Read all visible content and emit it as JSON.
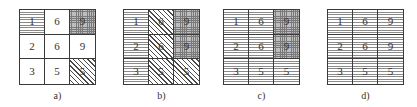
{
  "figure": {
    "patterns_legend": {
      "white": "no fill",
      "h": "horizontal lines",
      "d": "diagonal hatching",
      "x": "crosshatch / grid"
    },
    "panels": [
      {
        "label": "a)",
        "cells": [
          {
            "value": "1",
            "pattern": "h"
          },
          {
            "value": "6",
            "pattern": "white"
          },
          {
            "value": "9",
            "pattern": "x"
          },
          {
            "value": "2",
            "pattern": "white"
          },
          {
            "value": "6",
            "pattern": "white"
          },
          {
            "value": "9",
            "pattern": "white"
          },
          {
            "value": "3",
            "pattern": "white"
          },
          {
            "value": "5",
            "pattern": "white"
          },
          {
            "value": "5",
            "pattern": "d"
          }
        ]
      },
      {
        "label": "b)",
        "cells": [
          {
            "value": "1",
            "pattern": "h"
          },
          {
            "value": "6",
            "pattern": "d"
          },
          {
            "value": "9",
            "pattern": "x"
          },
          {
            "value": "2",
            "pattern": "h"
          },
          {
            "value": "6",
            "pattern": "d"
          },
          {
            "value": "9",
            "pattern": "x"
          },
          {
            "value": "3",
            "pattern": "h"
          },
          {
            "value": "5",
            "pattern": "d"
          },
          {
            "value": "5",
            "pattern": "d"
          }
        ]
      },
      {
        "label": "c)",
        "cells": [
          {
            "value": "1",
            "pattern": "h"
          },
          {
            "value": "6",
            "pattern": "h"
          },
          {
            "value": "9",
            "pattern": "x"
          },
          {
            "value": "2",
            "pattern": "h"
          },
          {
            "value": "6",
            "pattern": "h"
          },
          {
            "value": "9",
            "pattern": "x"
          },
          {
            "value": "3",
            "pattern": "h"
          },
          {
            "value": "5",
            "pattern": "h"
          },
          {
            "value": "5",
            "pattern": "h"
          }
        ]
      },
      {
        "label": "d)",
        "cells": [
          {
            "value": "1",
            "pattern": "h"
          },
          {
            "value": "6",
            "pattern": "h"
          },
          {
            "value": "9",
            "pattern": "h"
          },
          {
            "value": "2",
            "pattern": "h"
          },
          {
            "value": "6",
            "pattern": "h"
          },
          {
            "value": "9",
            "pattern": "h"
          },
          {
            "value": "3",
            "pattern": "h"
          },
          {
            "value": "5",
            "pattern": "h"
          },
          {
            "value": "5",
            "pattern": "h"
          }
        ]
      }
    ],
    "colors": {
      "border": "#3a3a3a",
      "text": "#333333",
      "background": "#ffffff"
    }
  }
}
